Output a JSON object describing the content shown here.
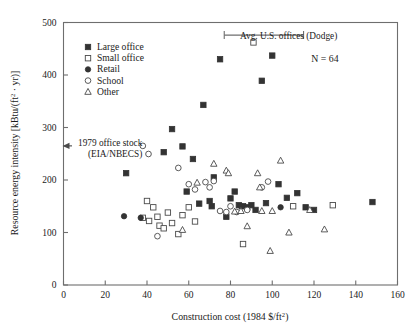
{
  "chart_data": {
    "type": "scatter",
    "title": "",
    "xlabel": "Construction cost (1984 $/ft2)",
    "ylabel": "Resource energy intensity [kBtu/(ft2 · yr)]",
    "xlim": [
      0,
      160
    ],
    "ylim": [
      0,
      500
    ],
    "xticks": [
      0,
      20,
      40,
      60,
      80,
      100,
      120,
      140,
      160
    ],
    "yticks": [
      0,
      100,
      200,
      300,
      400,
      500
    ],
    "grid": false,
    "legend_position": "top-left",
    "n_label": "N = 64",
    "series": [
      {
        "name": "Large office",
        "marker": "filled-square",
        "points": [
          [
            30,
            213
          ],
          [
            48,
            253
          ],
          [
            52,
            297
          ],
          [
            57,
            264
          ],
          [
            59,
            178
          ],
          [
            62,
            240
          ],
          [
            65,
            155
          ],
          [
            67,
            343
          ],
          [
            70,
            160
          ],
          [
            71,
            150
          ],
          [
            72,
            205
          ],
          [
            75,
            430
          ],
          [
            78,
            130
          ],
          [
            80,
            165
          ],
          [
            82,
            178
          ],
          [
            84,
            152
          ],
          [
            86,
            150
          ],
          [
            88,
            148
          ],
          [
            90,
            152
          ],
          [
            92,
            143
          ],
          [
            95,
            389
          ],
          [
            97,
            156
          ],
          [
            100,
            437
          ],
          [
            103,
            192
          ],
          [
            107,
            166
          ],
          [
            112,
            175
          ],
          [
            116,
            148
          ],
          [
            120,
            143
          ],
          [
            148,
            158
          ]
        ]
      },
      {
        "name": "Small office",
        "marker": "open-square",
        "points": [
          [
            38,
            128
          ],
          [
            40,
            160
          ],
          [
            41,
            122
          ],
          [
            43,
            148
          ],
          [
            45,
            130
          ],
          [
            46,
            113
          ],
          [
            48,
            108
          ],
          [
            50,
            138
          ],
          [
            52,
            118
          ],
          [
            55,
            97
          ],
          [
            57,
            133
          ],
          [
            60,
            148
          ],
          [
            63,
            121
          ],
          [
            91,
            462
          ],
          [
            110,
            150
          ],
          [
            129,
            152
          ],
          [
            86,
            78
          ]
        ]
      },
      {
        "name": "Retail",
        "marker": "filled-circle",
        "points": [
          [
            29,
            131
          ],
          [
            37,
            128
          ],
          [
            85,
            150
          ],
          [
            104,
            148
          ]
        ]
      },
      {
        "name": "School",
        "marker": "open-circle",
        "points": [
          [
            38,
            265
          ],
          [
            45,
            93
          ],
          [
            55,
            223
          ],
          [
            60,
            192
          ],
          [
            63,
            182
          ],
          [
            68,
            196
          ],
          [
            70,
            186
          ],
          [
            72,
            198
          ],
          [
            75,
            141
          ],
          [
            78,
            139
          ],
          [
            80,
            150
          ],
          [
            83,
            139
          ],
          [
            88,
            143
          ],
          [
            95,
            186
          ],
          [
            98,
            197
          ]
        ]
      },
      {
        "name": "Other",
        "marker": "open-triangle",
        "points": [
          [
            57,
            105
          ],
          [
            64,
            195
          ],
          [
            72,
            231
          ],
          [
            78,
            218
          ],
          [
            79,
            213
          ],
          [
            82,
            140
          ],
          [
            85,
            141
          ],
          [
            88,
            112
          ],
          [
            93,
            213
          ],
          [
            94,
            186
          ],
          [
            95,
            141
          ],
          [
            100,
            141
          ],
          [
            104,
            237
          ],
          [
            108,
            100
          ],
          [
            118,
            143
          ],
          [
            125,
            106
          ],
          [
            99,
            65
          ]
        ]
      }
    ],
    "annotations": [
      {
        "id": "avg-us-offices",
        "text": "Avg. U.S. offices (Dodge)",
        "type": "error-bar-horizontal",
        "y": 476,
        "x_low": 77,
        "x_high": 115
      },
      {
        "id": "office-stock-1979",
        "text_line1": "1979 office stock",
        "text_line2": "(EIA/NBECS)",
        "type": "arrow-left",
        "y": 265,
        "marker": "open-circle",
        "marker_x": 38
      }
    ],
    "legend_entries": [
      {
        "label": "Large office",
        "marker": "filled-square"
      },
      {
        "label": "Small office",
        "marker": "open-square"
      },
      {
        "label": "Retail",
        "marker": "filled-circle"
      },
      {
        "label": "School",
        "marker": "open-circle"
      },
      {
        "label": "Other",
        "marker": "open-triangle"
      }
    ]
  },
  "axis": {
    "x_title_main": "Construction cost (1984 $/ft",
    "x_title_sup": "2",
    "x_title_tail": ")",
    "y_title_main": "Resource energy intensity [kBtu/(ft",
    "y_title_sup": "2",
    "y_title_tail": " · yr)]",
    "xticklabels": [
      "0",
      "20",
      "40",
      "60",
      "80",
      "100",
      "120",
      "140",
      "160"
    ],
    "yticklabels": [
      "0",
      "100",
      "200",
      "300",
      "400",
      "500"
    ]
  },
  "colors": {
    "marker_fill": "#333333",
    "marker_open_stroke": "#4a4a4a",
    "axis": "#6e6e6e",
    "text": "#1a1a1a",
    "background": "#ffffff"
  }
}
